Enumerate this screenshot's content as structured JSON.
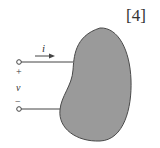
{
  "reference": "[4]",
  "labels": {
    "current": "i",
    "voltage": "v",
    "plus": "+",
    "minus": "−"
  },
  "colors": {
    "blob_fill": "#9a9a9a",
    "blob_stroke": "#4a4a4a",
    "wire": "#444444",
    "text": "#333333"
  }
}
